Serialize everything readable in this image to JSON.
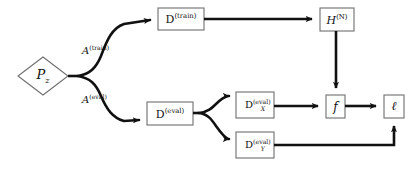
{
  "figure": {
    "type": "flow-diagram",
    "canvas": {
      "width": 414,
      "height": 173
    },
    "background_color": "#ffffff",
    "stroke_color": "#111111",
    "text_color": "#101010"
  },
  "nodes": {
    "pz": {
      "id": "pz",
      "shape": "diamond",
      "label_base": "P",
      "label_sub": "z",
      "label_plain": "P_z",
      "x": 18,
      "y": 57,
      "width": 50,
      "height": 38
    },
    "d_train": {
      "id": "d_train",
      "shape": "rect",
      "label_base": "D",
      "label_sup": "(train)",
      "label_plain": "D^(train)",
      "x": 158,
      "y": 8,
      "width": 46,
      "height": 22
    },
    "h_n": {
      "id": "h_n",
      "shape": "rect",
      "label_base": "H",
      "label_sup": "(N)",
      "label_plain": "H^(N)",
      "x": 320,
      "y": 8,
      "width": 34,
      "height": 23
    },
    "d_eval": {
      "id": "d_eval",
      "shape": "rect",
      "label_base": "D",
      "label_sup": "(eval)",
      "label_plain": "D^(eval)",
      "x": 147,
      "y": 102,
      "width": 46,
      "height": 23
    },
    "d_eval_x": {
      "id": "d_eval_x",
      "shape": "rect",
      "label_base": "D",
      "label_sub": "X",
      "label_sup": "(eval)",
      "label_plain": "D_X^(eval)",
      "x": 236,
      "y": 92,
      "width": 38,
      "height": 26
    },
    "d_eval_y": {
      "id": "d_eval_y",
      "shape": "rect",
      "label_base": "D",
      "label_sub": "Y",
      "label_sup": "(eval)",
      "label_plain": "D_Y^(eval)",
      "x": 236,
      "y": 132,
      "width": 38,
      "height": 26
    },
    "f": {
      "id": "f",
      "shape": "rect",
      "label_base": "f",
      "label_plain": "f",
      "x": 326,
      "y": 95,
      "width": 19,
      "height": 23
    },
    "loss": {
      "id": "loss",
      "shape": "rect",
      "label_base": "ℓ",
      "label_plain": "ell",
      "x": 384,
      "y": 95,
      "width": 20,
      "height": 23
    }
  },
  "edge_labels": [
    {
      "id": "a_train",
      "base": "A",
      "sup": "(train)",
      "plain": "A^(train)",
      "x": 82,
      "y": 44
    },
    {
      "id": "a_eval",
      "base": "A",
      "sup": "(eval)",
      "plain": "A^(eval)",
      "x": 82,
      "y": 93
    }
  ],
  "edges": [
    {
      "from": "pz",
      "to": "fork-1",
      "label": null
    },
    {
      "from": "fork-1",
      "to": "d_train",
      "label": "a_train"
    },
    {
      "from": "fork-1",
      "to": "d_eval",
      "label": "a_eval"
    },
    {
      "from": "d_train",
      "to": "h_n",
      "label": null
    },
    {
      "from": "h_n",
      "to": "f",
      "label": null
    },
    {
      "from": "d_eval",
      "to": "d_eval_x",
      "label": null
    },
    {
      "from": "d_eval",
      "to": "d_eval_y",
      "label": null
    },
    {
      "from": "d_eval_x",
      "to": "f",
      "label": null
    },
    {
      "from": "f",
      "to": "loss",
      "label": null
    },
    {
      "from": "d_eval_y",
      "to": "loss",
      "label": null
    }
  ]
}
